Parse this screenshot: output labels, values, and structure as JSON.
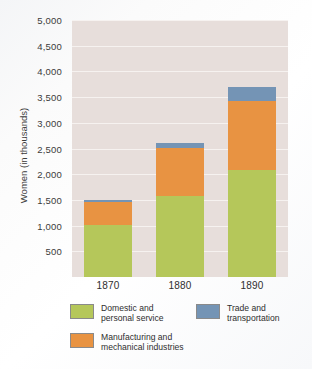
{
  "chart_data": {
    "type": "bar",
    "subtype": "stacked-bar",
    "title": "",
    "xlabel": "",
    "ylabel": "Women (in thousands)",
    "categories": [
      "1870",
      "1880",
      "1890"
    ],
    "series": [
      {
        "name": "Domestic and personal service",
        "color": "#b5c75a",
        "values": [
          1010,
          1570,
          2080
        ]
      },
      {
        "name": "Manufacturing and mechanical industries",
        "color": "#e89342",
        "values": [
          450,
          940,
          1350
        ]
      },
      {
        "name": "Trade and transportation",
        "color": "#7494b5",
        "values": [
          40,
          90,
          270
        ]
      }
    ],
    "totals": [
      1500,
      2600,
      3700
    ],
    "ylim": [
      0,
      5000
    ],
    "ytick_values": [
      500,
      1000,
      1500,
      2000,
      2500,
      3000,
      3500,
      4000,
      4500,
      5000
    ],
    "ytick_labels": [
      "500",
      "1,000",
      "1,500",
      "2,000",
      "2,500",
      "3,000",
      "3,500",
      "4,000",
      "4,500",
      "5,000"
    ],
    "grid": true,
    "grid_color": "#f6f2f0",
    "plot_background": "#e7dedb",
    "legend_position": "bottom"
  },
  "legend": {
    "items": [
      {
        "label_line1": "Domestic and",
        "label_line2": "personal service",
        "swatch": "green-swatch"
      },
      {
        "label_line1": "Manufacturing and",
        "label_line2": "mechanical industries",
        "swatch": "orange-swatch"
      },
      {
        "label_line1": "Trade and",
        "label_line2": "transportation",
        "swatch": "blue-swatch"
      }
    ]
  }
}
